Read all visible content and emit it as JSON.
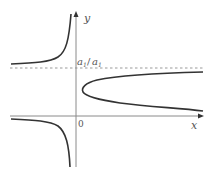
{
  "figure": {
    "axes": {
      "x_label": "x",
      "y_label": "y",
      "origin_label": "0"
    },
    "asymptote_label": {
      "numerator": "a",
      "numerator_sub": "1",
      "slash": "/",
      "denominator": "a",
      "denominator_sub": "1"
    },
    "colors": {
      "curve": "#333333",
      "axis": "#888888",
      "dashed": "#999999"
    }
  }
}
